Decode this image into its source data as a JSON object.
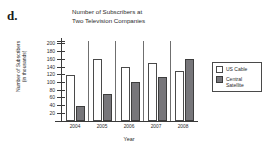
{
  "problem_label": "d.",
  "legend": {
    "position": "right",
    "items": [
      {
        "name": "US Cable",
        "swatch": "open-square-icon",
        "color": "#ffffff"
      },
      {
        "name": "Central Satellite",
        "line1": "Central",
        "line2": "Satellite",
        "swatch": "filled-square-icon",
        "color": "#77767a"
      }
    ]
  },
  "chart_data": {
    "type": "bar",
    "title": "Number of Subscribers at Two Television Companies",
    "title_line1": "Number of Subscribers at",
    "title_line2": "Two Television Companies",
    "xlabel": "Year",
    "ylabel": "Number of Subscribers (in thousands)",
    "ylabel_line1": "Number of Subscribers",
    "ylabel_line2": "(in thousands)",
    "categories": [
      "2004",
      "2005",
      "2006",
      "2007",
      "2008"
    ],
    "series": [
      {
        "name": "US Cable",
        "values": [
          120,
          160,
          140,
          150,
          130
        ],
        "color": "#ffffff"
      },
      {
        "name": "Central Satellite",
        "values": [
          40,
          70,
          100,
          115,
          160
        ],
        "color": "#77767a"
      }
    ],
    "ylim": [
      0,
      210
    ],
    "yticks": [
      20,
      40,
      60,
      80,
      100,
      120,
      140,
      160,
      180,
      200
    ],
    "grid": false,
    "legend_position": "right"
  }
}
